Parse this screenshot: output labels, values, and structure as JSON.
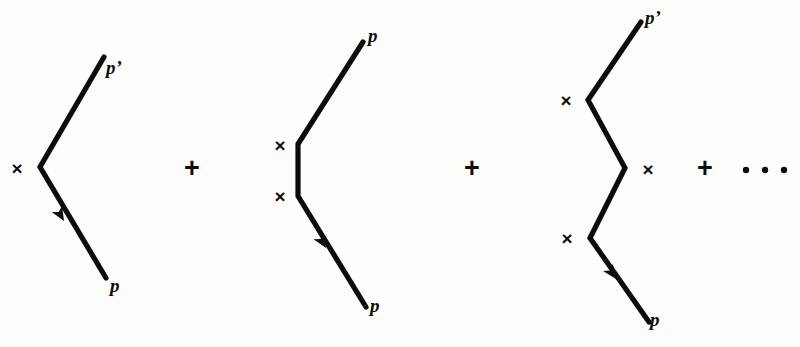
{
  "figure": {
    "background_color": "#fdfdfb",
    "ink_color": "#0c0c0c",
    "operators": [
      {
        "name": "plus-1",
        "symbol": "+",
        "x": 192,
        "y": 168
      },
      {
        "name": "plus-2",
        "symbol": "+",
        "x": 472,
        "y": 168
      },
      {
        "name": "plus-3",
        "symbol": "+",
        "x": 705,
        "y": 168
      }
    ],
    "ellipsis": {
      "name": "continuation-ellipsis",
      "symbol": "· · ·",
      "dots": [
        {
          "cx": 746,
          "cy": 170,
          "r": 3.2
        },
        {
          "cx": 765,
          "cy": 170,
          "r": 3.2
        },
        {
          "cx": 784,
          "cy": 170,
          "r": 3.2
        }
      ]
    },
    "diagrams": [
      {
        "id": "first-order-diagram",
        "order": 1,
        "scattering_vertices": 1,
        "path": "M 104 57 L 40 167 L 106 278",
        "crosses": [
          {
            "label": "×",
            "x": 17,
            "y": 168
          }
        ],
        "labels": [
          {
            "name": "outgoing-momentum-label",
            "text": "p’",
            "x": 106,
            "y": 70,
            "anchor": "start"
          },
          {
            "name": "incoming-momentum-label",
            "text": "p",
            "x": 110,
            "y": 288,
            "anchor": "start"
          }
        ],
        "arrow": {
          "name": "incoming-direction-arrow",
          "tip_x": 64,
          "tip_y": 221,
          "angle_deg": 239.5
        }
      },
      {
        "id": "second-order-diagram",
        "order": 2,
        "scattering_vertices": 2,
        "path": "M 363 42 L 298 144 L 298 196 L 366 307",
        "crosses": [
          {
            "label": "×",
            "x": 280,
            "y": 145
          },
          {
            "label": "×",
            "x": 280,
            "y": 196
          }
        ],
        "labels": [
          {
            "name": "outgoing-momentum-label",
            "text": "p",
            "x": 368,
            "y": 38,
            "anchor": "start"
          },
          {
            "name": "incoming-momentum-label",
            "text": "p",
            "x": 370,
            "y": 308,
            "anchor": "start"
          }
        ],
        "arrow": {
          "name": "incoming-direction-arrow",
          "tip_x": 326,
          "tip_y": 248,
          "angle_deg": 238.5
        }
      },
      {
        "id": "third-order-diagram",
        "order": 3,
        "scattering_vertices": 3,
        "path": "M 641 22 L 588 100 L 625 168 L 590 238 L 649 322",
        "crosses": [
          {
            "label": "×",
            "x": 566,
            "y": 100
          },
          {
            "label": "×",
            "x": 648,
            "y": 169
          },
          {
            "label": "×",
            "x": 567,
            "y": 238
          }
        ],
        "labels": [
          {
            "name": "outgoing-momentum-label",
            "text": "p’",
            "x": 645,
            "y": 20,
            "anchor": "start"
          },
          {
            "name": "incoming-momentum-label",
            "text": "p",
            "x": 650,
            "y": 322,
            "anchor": "start"
          }
        ],
        "arrow": {
          "name": "incoming-direction-arrow",
          "tip_x": 616,
          "tip_y": 279,
          "angle_deg": 235.0
        }
      }
    ]
  }
}
